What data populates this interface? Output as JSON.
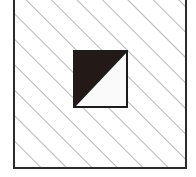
{
  "figure": {
    "canvas": {
      "width": 196,
      "height": 177,
      "background_color": "#ffffff"
    },
    "outer_square": {
      "name": "outer-square",
      "x": 13,
      "y": -4,
      "width": 174,
      "height": 173,
      "stroke_color": "#2b2b2b",
      "stroke_width": 2,
      "fill_color": "#ffffff",
      "fill_description": "diagonal hatch"
    },
    "hatch": {
      "name": "diagonal-hatch-pattern",
      "angle_degrees": 45,
      "direction": "lower-left to upper-right",
      "spacing_px": 18,
      "line_width": 1.2,
      "line_color": "#8a8a8a"
    },
    "inner_square": {
      "name": "inner-square",
      "x": 73,
      "y": 50,
      "width": 55,
      "height": 58,
      "stroke_color": "#1c1c1c",
      "stroke_width": 2,
      "shaded_half": "upper-left",
      "unshaded_half": "lower-right",
      "shaded_color": "#231a18",
      "unshaded_color": "#fafafa",
      "diagonal": "from top-right corner to bottom-left corner"
    }
  }
}
